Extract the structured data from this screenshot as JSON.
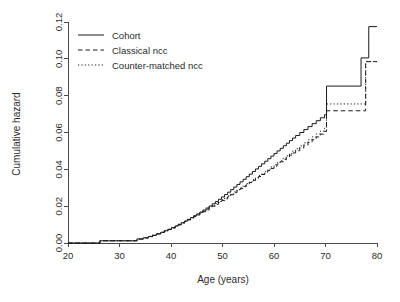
{
  "chart_data": {
    "type": "line",
    "title": "",
    "xlabel": "Age (years)",
    "ylabel": "Cumulative hazard",
    "xlim": [
      20,
      80
    ],
    "ylim": [
      0.0,
      0.12
    ],
    "xticks": [
      20,
      30,
      40,
      50,
      60,
      70,
      80
    ],
    "xtick_labels": [
      "20",
      "30",
      "40",
      "50",
      "60",
      "70",
      "80"
    ],
    "yticks": [
      0.0,
      0.02,
      0.04,
      0.06,
      0.08,
      0.1,
      0.12
    ],
    "ytick_labels": [
      "0.00",
      "0.02",
      "0.04",
      "0.06",
      "0.08",
      "0.10",
      "0.12"
    ],
    "grid": false,
    "legend_position": "top-left inside plot",
    "step_type": "post",
    "series": [
      {
        "name": "Cohort",
        "linestyle": "solid",
        "color": "#1a1a1a",
        "x": [
          20,
          25.4,
          26.2,
          32.6,
          33.4,
          34.6,
          35.6,
          36.4,
          37.2,
          38.0,
          38.7,
          39.4,
          40.1,
          40.8,
          41.4,
          42.0,
          42.6,
          43.2,
          43.8,
          44.4,
          45.0,
          45.6,
          46.2,
          46.8,
          47.4,
          48.0,
          48.6,
          49.2,
          49.8,
          50.4,
          51.0,
          51.6,
          52.2,
          52.8,
          53.4,
          54.0,
          54.6,
          55.2,
          55.8,
          56.4,
          57.0,
          57.6,
          58.2,
          58.8,
          59.4,
          60.0,
          60.6,
          61.2,
          61.8,
          62.4,
          63.0,
          63.6,
          64.2,
          65.0,
          65.8,
          66.6,
          67.4,
          68.2,
          69.0,
          69.8,
          70.2,
          76.9,
          78.4,
          80.0
        ],
        "y": [
          0.0,
          0.0,
          0.0012,
          0.0012,
          0.0022,
          0.0028,
          0.0035,
          0.0042,
          0.005,
          0.0058,
          0.0066,
          0.0074,
          0.0083,
          0.0092,
          0.0101,
          0.011,
          0.0119,
          0.0128,
          0.0138,
          0.0148,
          0.0158,
          0.0168,
          0.0179,
          0.019,
          0.0201,
          0.0213,
          0.0225,
          0.0237,
          0.025,
          0.0263,
          0.0276,
          0.029,
          0.0304,
          0.0318,
          0.0332,
          0.0346,
          0.036,
          0.0374,
          0.0388,
          0.0402,
          0.0416,
          0.043,
          0.0444,
          0.0458,
          0.0472,
          0.0486,
          0.05,
          0.0514,
          0.0528,
          0.0542,
          0.0556,
          0.057,
          0.0584,
          0.06,
          0.0616,
          0.0632,
          0.0648,
          0.0664,
          0.068,
          0.0696,
          0.0852,
          0.1005,
          0.1175,
          0.1175
        ]
      },
      {
        "name": "Classical ncc",
        "linestyle": "dashed",
        "color": "#1a1a1a",
        "x": [
          20,
          25.4,
          26.2,
          32.6,
          33.4,
          34.6,
          35.6,
          36.4,
          37.2,
          38.0,
          38.7,
          39.4,
          40.1,
          40.8,
          41.4,
          42.0,
          42.6,
          43.2,
          43.8,
          44.4,
          45.0,
          45.6,
          46.2,
          46.8,
          47.4,
          48.0,
          48.6,
          49.2,
          49.8,
          50.4,
          51.0,
          51.6,
          52.2,
          52.8,
          53.4,
          54.0,
          54.6,
          55.2,
          55.8,
          56.4,
          57.0,
          57.6,
          58.2,
          58.8,
          59.4,
          60.0,
          60.6,
          61.2,
          61.8,
          62.4,
          63.0,
          63.6,
          64.2,
          65.0,
          65.8,
          66.6,
          67.4,
          68.2,
          69.0,
          69.8,
          70.2,
          77.8,
          80.0
        ],
        "y": [
          0.0,
          0.0,
          0.0012,
          0.0012,
          0.0021,
          0.0027,
          0.0034,
          0.0041,
          0.0049,
          0.0057,
          0.0065,
          0.0073,
          0.0081,
          0.009,
          0.0098,
          0.0107,
          0.0116,
          0.0125,
          0.0134,
          0.0143,
          0.0152,
          0.0161,
          0.017,
          0.018,
          0.019,
          0.02,
          0.021,
          0.022,
          0.023,
          0.024,
          0.0251,
          0.0262,
          0.0273,
          0.0284,
          0.0295,
          0.0306,
          0.0317,
          0.0328,
          0.0339,
          0.035,
          0.0361,
          0.0372,
          0.0383,
          0.0394,
          0.0405,
          0.0417,
          0.0429,
          0.0441,
          0.0453,
          0.0465,
          0.0477,
          0.0489,
          0.0501,
          0.0516,
          0.0531,
          0.0546,
          0.0561,
          0.0576,
          0.0591,
          0.0606,
          0.0718,
          0.0985,
          0.0985
        ]
      },
      {
        "name": "Counter-matched ncc",
        "linestyle": "dotted",
        "color": "#1a1a1a",
        "x": [
          20,
          25.4,
          26.2,
          32.6,
          33.4,
          34.6,
          35.6,
          36.4,
          37.2,
          38.0,
          38.7,
          39.4,
          40.1,
          40.8,
          41.4,
          42.0,
          42.6,
          43.2,
          43.8,
          44.4,
          45.0,
          45.6,
          46.2,
          46.8,
          47.4,
          48.0,
          48.6,
          49.2,
          49.8,
          50.4,
          51.0,
          51.6,
          52.2,
          52.8,
          53.4,
          54.0,
          54.6,
          55.2,
          55.8,
          56.4,
          57.0,
          57.6,
          58.2,
          58.8,
          59.4,
          60.0,
          60.6,
          61.2,
          61.8,
          62.4,
          63.0,
          63.6,
          64.2,
          65.0,
          65.8,
          66.6,
          67.4,
          68.2,
          69.0,
          69.8,
          70.2,
          77.8,
          80.0
        ],
        "y": [
          0.0,
          0.0,
          0.0012,
          0.0012,
          0.0022,
          0.0028,
          0.0036,
          0.0043,
          0.0051,
          0.0059,
          0.0067,
          0.0076,
          0.0085,
          0.0094,
          0.0102,
          0.0111,
          0.012,
          0.0129,
          0.0138,
          0.0147,
          0.0156,
          0.0165,
          0.0175,
          0.0185,
          0.0195,
          0.0205,
          0.0215,
          0.0225,
          0.0235,
          0.0245,
          0.0256,
          0.0267,
          0.0278,
          0.0289,
          0.03,
          0.0311,
          0.0322,
          0.0333,
          0.0344,
          0.0355,
          0.0366,
          0.0377,
          0.0389,
          0.0401,
          0.0413,
          0.0425,
          0.0437,
          0.0449,
          0.0461,
          0.0473,
          0.0486,
          0.0499,
          0.0512,
          0.0528,
          0.0544,
          0.056,
          0.0576,
          0.0592,
          0.0608,
          0.0624,
          0.0755,
          0.0985,
          0.0985
        ]
      }
    ]
  },
  "legend": {
    "items": [
      {
        "label": "Cohort",
        "style": "solid"
      },
      {
        "label": "Classical ncc",
        "style": "dashed"
      },
      {
        "label": "Counter-matched ncc",
        "style": "dotted"
      }
    ]
  },
  "axes": {
    "x_title": "Age (years)",
    "y_title": "Cumulative hazard"
  }
}
